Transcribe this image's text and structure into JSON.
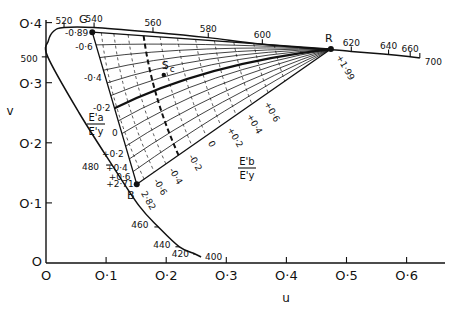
{
  "chart_data": {
    "type": "line",
    "title": "",
    "xlabel": "u",
    "ylabel": "v",
    "xlim": [
      0,
      0.65
    ],
    "ylim": [
      0,
      0.42
    ],
    "x_ticks": [
      {
        "value": 0,
        "label": "O"
      },
      {
        "value": 0.1,
        "label": "O·1"
      },
      {
        "value": 0.2,
        "label": "O·2"
      },
      {
        "value": 0.3,
        "label": "O·3"
      },
      {
        "value": 0.4,
        "label": "O·4"
      },
      {
        "value": 0.5,
        "label": "O·5"
      },
      {
        "value": 0.6,
        "label": "O·6"
      }
    ],
    "y_ticks": [
      {
        "value": 0,
        "label": "O"
      },
      {
        "value": 0.1,
        "label": "O·1"
      },
      {
        "value": 0.2,
        "label": "O·2"
      },
      {
        "value": 0.3,
        "label": "O·3"
      },
      {
        "value": 0.4,
        "label": "O·4"
      }
    ],
    "spectrum_locus": {
      "name": "spectrum-locus",
      "points": [
        {
          "nm": 400,
          "u": 0.258,
          "v": 0.01
        },
        {
          "nm": 420,
          "u": 0.248,
          "v": 0.015
        },
        {
          "nm": 440,
          "u": 0.222,
          "v": 0.027
        },
        {
          "nm": 460,
          "u": 0.187,
          "v": 0.06
        },
        {
          "nm": 470,
          "u": 0.155,
          "v": 0.095
        },
        {
          "nm": 480,
          "u": 0.11,
          "v": 0.163
        },
        {
          "nm": 490,
          "u": 0.055,
          "v": 0.25
        },
        {
          "nm": 500,
          "u": 0.003,
          "v": 0.343
        },
        {
          "nm": 505,
          "u": 0.004,
          "v": 0.37
        },
        {
          "nm": 510,
          "u": 0.013,
          "v": 0.386
        },
        {
          "nm": 520,
          "u": 0.03,
          "v": 0.392
        },
        {
          "nm": 540,
          "u": 0.08,
          "v": 0.392
        },
        {
          "nm": 560,
          "u": 0.178,
          "v": 0.384
        },
        {
          "nm": 580,
          "u": 0.27,
          "v": 0.375
        },
        {
          "nm": 600,
          "u": 0.36,
          "v": 0.364
        },
        {
          "nm": 620,
          "u": 0.508,
          "v": 0.352
        },
        {
          "nm": 640,
          "u": 0.57,
          "v": 0.347
        },
        {
          "nm": 660,
          "u": 0.606,
          "v": 0.343
        },
        {
          "nm": 700,
          "u": 0.622,
          "v": 0.341
        }
      ],
      "labels": [
        "400",
        "420",
        "440",
        "460",
        "480",
        "500",
        "520",
        "540",
        "560",
        "580",
        "600",
        "620",
        "640",
        "660",
        "700"
      ]
    },
    "primaries": [
      {
        "name": "G",
        "u": 0.077,
        "v": 0.384,
        "value_label": "-0·89"
      },
      {
        "name": "R",
        "u": 0.474,
        "v": 0.356,
        "value_label": "+1·99"
      },
      {
        "name": "B",
        "u": 0.151,
        "v": 0.131,
        "value_label": "+2·71",
        "value_label_2": "2·82"
      }
    ],
    "white_point": {
      "name": "Sc",
      "u": 0.196,
      "v": 0.313
    },
    "side_GB_labels": [
      {
        "t": 0.1,
        "label": "-0·6"
      },
      {
        "t": 0.3,
        "label": "-0·4"
      },
      {
        "t": 0.5,
        "label": "-0·2"
      },
      {
        "t": 0.66,
        "label": "0"
      },
      {
        "t": 0.8,
        "label": "+0·2"
      },
      {
        "t": 0.89,
        "label": "+0·4"
      },
      {
        "t": 0.95,
        "label": "+0·6"
      }
    ],
    "side_BR_labels": [
      {
        "t": 0.07,
        "label": "-0·6"
      },
      {
        "t": 0.15,
        "label": "-0·4"
      },
      {
        "t": 0.25,
        "label": "-0·2"
      },
      {
        "t": 0.35,
        "label": "0"
      },
      {
        "t": 0.45,
        "label": "+0·2"
      },
      {
        "t": 0.55,
        "label": "+0·4"
      },
      {
        "t": 0.64,
        "label": "+0·6"
      }
    ],
    "ratio_labels": {
      "a": {
        "num": "E'a",
        "den": "E'y"
      },
      "b": {
        "num": "E'b",
        "den": "E'y"
      }
    },
    "grid_curves_a": [
      -0.6,
      -0.4,
      -0.2,
      0,
      0.2,
      0.4,
      0.6
    ],
    "grid_curves_b": [
      -0.6,
      -0.4,
      -0.2,
      0,
      0.2,
      0.4,
      0.6
    ]
  }
}
